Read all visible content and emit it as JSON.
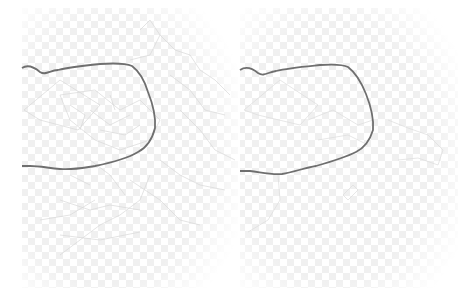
{
  "figure": {
    "panels": [
      {
        "id": "left",
        "description": "Map panel with dense administrative subdivisions",
        "boundary_color": "#6f6f6f",
        "subdivision_color": "#d6d6d6",
        "checker_color": "#f1f1f1"
      },
      {
        "id": "right",
        "description": "Map panel with sparse administrative subdivisions",
        "boundary_color": "#6f6f6f",
        "subdivision_color": "#dadada",
        "checker_color": "#f1f1f1"
      }
    ]
  }
}
